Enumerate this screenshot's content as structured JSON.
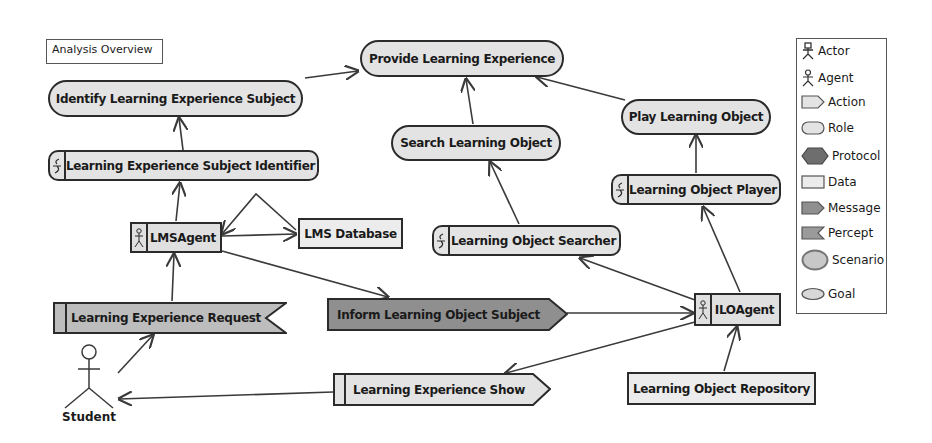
{
  "diagram": {
    "title": "Analysis Overview",
    "goals": [
      {
        "id": "provide",
        "label": "Provide Learning Experience"
      },
      {
        "id": "identify",
        "label": "Identify Learning Experience Subject"
      },
      {
        "id": "play",
        "label": "Play Learning Object"
      },
      {
        "id": "search",
        "label": "Search Learning Object"
      }
    ],
    "roles": [
      {
        "id": "lesi",
        "label": "Learning Experience Subject Identifier"
      },
      {
        "id": "lop",
        "label": "Learning Object Player"
      },
      {
        "id": "los",
        "label": "Learning Object Searcher"
      }
    ],
    "agents": [
      {
        "id": "lmsagent",
        "label": "LMSAgent"
      },
      {
        "id": "iloagent",
        "label": "ILOAgent"
      }
    ],
    "data": [
      {
        "id": "lmsdb",
        "label": "LMS Database"
      },
      {
        "id": "lor",
        "label": "Learning Object Repository"
      }
    ],
    "percepts": [
      {
        "id": "ler",
        "label": "Learning Experience Request"
      }
    ],
    "messages": [
      {
        "id": "ilos",
        "label": "Inform Learning Object Subject"
      }
    ],
    "actions": [
      {
        "id": "les",
        "label": "Learning Experience Show"
      }
    ],
    "actors": [
      {
        "id": "student",
        "label": "Student"
      }
    ],
    "edges": [
      {
        "from": "identify",
        "to": "provide"
      },
      {
        "from": "search",
        "to": "provide"
      },
      {
        "from": "play",
        "to": "provide"
      },
      {
        "from": "lesi",
        "to": "identify"
      },
      {
        "from": "lop",
        "to": "play"
      },
      {
        "from": "los",
        "to": "search"
      },
      {
        "from": "lmsagent",
        "to": "lesi"
      },
      {
        "from": "lmsagent",
        "to": "lmsdb"
      },
      {
        "from": "lmsdb",
        "to": "lmsagent"
      },
      {
        "from": "lmsagent",
        "to": "ilos"
      },
      {
        "from": "ilos",
        "to": "iloagent"
      },
      {
        "from": "iloagent",
        "to": "los"
      },
      {
        "from": "iloagent",
        "to": "lop"
      },
      {
        "from": "iloagent",
        "to": "les"
      },
      {
        "from": "lor",
        "to": "iloagent"
      },
      {
        "from": "ler",
        "to": "lmsagent"
      },
      {
        "from": "student",
        "to": "ler"
      },
      {
        "from": "les",
        "to": "student"
      }
    ]
  },
  "legend": {
    "items": [
      {
        "label": "Actor",
        "icon": "actor-icon"
      },
      {
        "label": "Agent",
        "icon": "agent-icon"
      },
      {
        "label": "Action",
        "icon": "action-icon"
      },
      {
        "label": "Role",
        "icon": "role-icon"
      },
      {
        "label": "Protocol",
        "icon": "protocol-icon"
      },
      {
        "label": "Data",
        "icon": "data-icon"
      },
      {
        "label": "Message",
        "icon": "message-icon"
      },
      {
        "label": "Percept",
        "icon": "percept-icon"
      },
      {
        "label": "Scenario",
        "icon": "scenario-icon"
      },
      {
        "label": "Goal",
        "icon": "goal-icon"
      }
    ]
  },
  "colors": {
    "stroke": "#2b2b2b",
    "goal_fill": "#e3e3e3",
    "role_fill": "#e3e3e3",
    "agent_fill": "#e0e0e0",
    "data_fill": "#ececec",
    "percept_fill": "#bdbdbd",
    "message_fill": "#8f8f8f",
    "action_fill": "#e3e3e3",
    "protocol_fill": "#6e6e6e",
    "scenario_fill": "#c8c8c8",
    "edge": "#3a3a3a"
  }
}
